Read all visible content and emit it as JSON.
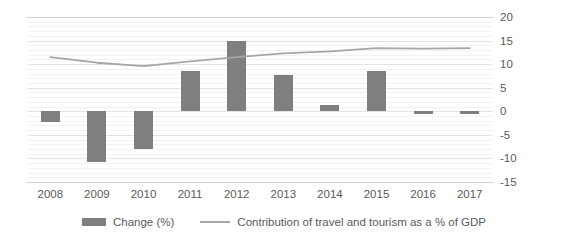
{
  "chart_data": {
    "type": "bar",
    "title": "",
    "xlabel": "",
    "ylabel": "",
    "categories": [
      "2008",
      "2009",
      "2010",
      "2011",
      "2012",
      "2013",
      "2014",
      "2015",
      "2016",
      "2017"
    ],
    "ylim": [
      -15,
      20
    ],
    "yticks": [
      20,
      15,
      10,
      5,
      0,
      -5,
      -10,
      -15
    ],
    "ytick_labels": [
      "20",
      "15",
      "10",
      "5",
      "0",
      "-5",
      "-10",
      "-15"
    ],
    "grid": true,
    "legend_position": "bottom",
    "series": [
      {
        "name": "Change (%)",
        "type": "bar",
        "color": "#7f7f7f",
        "values": [
          -2.3,
          -10.8,
          -8.0,
          8.5,
          15.0,
          7.7,
          1.3,
          8.5,
          -0.5,
          -0.5
        ]
      },
      {
        "name": "Contribution of travel and tourism as a % of GDP",
        "type": "line",
        "color": "#a6a6a6",
        "values": [
          11.5,
          10.3,
          9.6,
          10.6,
          11.5,
          12.3,
          12.7,
          13.4,
          13.3,
          13.4
        ]
      }
    ]
  },
  "legend": {
    "items": [
      {
        "label": "Change (%)",
        "marker": "bar-swatch",
        "color": "#7f7f7f"
      },
      {
        "label": "Contribution of travel and tourism as a % of GDP",
        "marker": "line-swatch",
        "color": "#a6a6a6"
      }
    ]
  },
  "colors": {
    "bar": "#7f7f7f",
    "line": "#a6a6a6",
    "gridline": "#e3e3e3",
    "text": "#5a5a5a",
    "background": "#ffffff"
  }
}
